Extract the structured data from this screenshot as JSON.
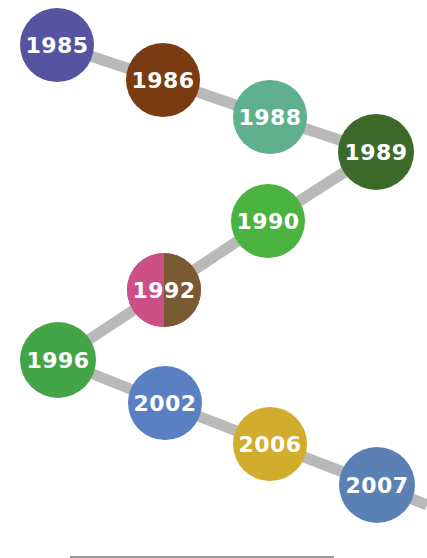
{
  "timeline": {
    "connector_color": "#b9b9b9",
    "text_color": "#ffffff",
    "nodes": [
      {
        "label": "1985",
        "color": "#5454a0",
        "cx": 57,
        "cy": 45,
        "r": 37
      },
      {
        "label": "1986",
        "color": "#7a3a12",
        "cx": 163,
        "cy": 80,
        "r": 37
      },
      {
        "label": "1988",
        "color": "#5fb08f",
        "cx": 270,
        "cy": 117,
        "r": 37
      },
      {
        "label": "1989",
        "color": "#3c6a2a",
        "cx": 376,
        "cy": 152,
        "r": 38
      },
      {
        "label": "1990",
        "color": "#4bb33f",
        "cx": 268,
        "cy": 221,
        "r": 37
      },
      {
        "label": "1992",
        "color": "#cc4f86",
        "color2": "#7a5a32",
        "cx": 164,
        "cy": 290,
        "r": 37
      },
      {
        "label": "1996",
        "color": "#43a547",
        "cx": 58,
        "cy": 360,
        "r": 38
      },
      {
        "label": "2002",
        "color": "#5a7fc2",
        "cx": 165,
        "cy": 403,
        "r": 37
      },
      {
        "label": "2006",
        "color": "#d2ac2c",
        "cx": 270,
        "cy": 444,
        "r": 37
      },
      {
        "label": "2007",
        "color": "#5a80b4",
        "cx": 377,
        "cy": 485,
        "r": 38
      }
    ],
    "tail_end": {
      "x": 427,
      "y": 505
    }
  }
}
